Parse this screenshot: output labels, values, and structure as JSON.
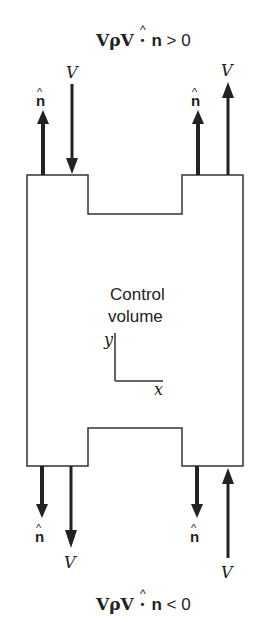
{
  "diagram": {
    "top_equation": {
      "lhs": "VρV · ",
      "nhat": "n",
      "rel": " > 0"
    },
    "bottom_equation": {
      "lhs": "VρV · ",
      "nhat": "n",
      "rel": " < 0"
    },
    "center_label": {
      "line1": "Control",
      "line2": "volume"
    },
    "axes": {
      "y": "y",
      "x": "x"
    },
    "arrow_labels": {
      "top_left_normal": "n",
      "top_left_velocity": "V",
      "top_right_normal": "n",
      "top_right_velocity": "V",
      "bottom_left_normal": "n",
      "bottom_left_velocity": "V",
      "bottom_right_normal": "n",
      "bottom_right_velocity": "V"
    },
    "colors": {
      "stroke": "#333333",
      "arrow": "#222222",
      "text": "#222222"
    }
  }
}
